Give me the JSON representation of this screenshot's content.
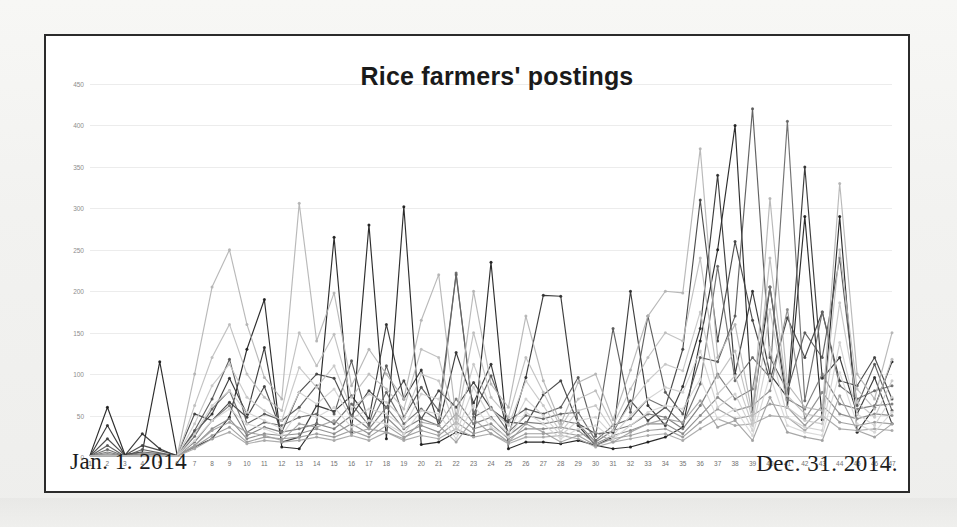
{
  "page": {
    "background": "#f4f4f2",
    "frame_border_color": "#2b2b2b",
    "plate_color": "#ffffff"
  },
  "chart_data": {
    "type": "line",
    "title": "Rice farmers' postings",
    "xlabel": "",
    "ylabel": "",
    "grid": true,
    "legend": "none",
    "xlim": [
      1,
      47
    ],
    "ylim": [
      0,
      450
    ],
    "ytick_values": [
      0,
      50,
      100,
      150,
      200,
      250,
      300,
      350,
      400,
      450
    ],
    "ytick_labels": [
      "0",
      "50",
      "100",
      "150",
      "200",
      "250",
      "300",
      "350",
      "400",
      "450"
    ],
    "categories": [
      1,
      2,
      3,
      4,
      5,
      6,
      7,
      8,
      9,
      10,
      11,
      12,
      13,
      14,
      15,
      16,
      17,
      18,
      19,
      20,
      21,
      22,
      23,
      24,
      25,
      26,
      27,
      28,
      29,
      30,
      31,
      32,
      33,
      34,
      35,
      36,
      37,
      38,
      39,
      40,
      41,
      42,
      43,
      44,
      45,
      46,
      47
    ],
    "xtick_labels": [
      "1",
      "2",
      "3",
      "4",
      "5",
      "6",
      "7",
      "8",
      "9",
      "10",
      "11",
      "12",
      "13",
      "14",
      "15",
      "16",
      "17",
      "18",
      "19",
      "20",
      "21",
      "22",
      "23",
      "24",
      "25",
      "26",
      "27",
      "28",
      "29",
      "30",
      "31",
      "32",
      "33",
      "34",
      "35",
      "36",
      "37",
      "38",
      "39",
      "40",
      "41",
      "42",
      "43",
      "44",
      "45",
      "46",
      "47"
    ],
    "annotations": {
      "start_date": "Jan. 1. 2014",
      "end_date": "Dec. 31. 2014."
    },
    "series": [
      {
        "name": "series-1",
        "color": "#1b1b1b",
        "values": [
          2,
          60,
          3,
          6,
          115,
          2,
          12,
          22,
          48,
          130,
          190,
          12,
          10,
          40,
          265,
          30,
          280,
          22,
          302,
          15,
          18,
          30,
          25,
          235,
          10,
          18,
          18,
          16,
          20,
          14,
          10,
          12,
          18,
          24,
          36,
          140,
          250,
          400,
          55,
          205,
          60,
          290,
          45,
          290,
          30,
          60,
          115
        ]
      },
      {
        "name": "series-2",
        "color": "#2e2e2e",
        "values": [
          1,
          38,
          2,
          28,
          10,
          1,
          30,
          52,
          95,
          52,
          132,
          18,
          24,
          62,
          55,
          74,
          46,
          160,
          70,
          105,
          38,
          126,
          65,
          112,
          26,
          96,
          195,
          194,
          38,
          14,
          24,
          200,
          62,
          38,
          85,
          155,
          340,
          100,
          200,
          100,
          72,
          350,
          95,
          120,
          52,
          96,
          40
        ]
      },
      {
        "name": "series-3",
        "color": "#3f3f3f",
        "values": [
          1,
          22,
          2,
          14,
          8,
          2,
          52,
          44,
          66,
          48,
          85,
          30,
          78,
          100,
          95,
          50,
          80,
          60,
          92,
          46,
          80,
          60,
          90,
          58,
          42,
          40,
          75,
          92,
          40,
          28,
          30,
          68,
          44,
          60,
          130,
          310,
          140,
          260,
          165,
          92,
          168,
          120,
          175,
          92,
          86,
          120,
          70
        ]
      },
      {
        "name": "series-4",
        "color": "#555555",
        "values": [
          1,
          14,
          1,
          9,
          5,
          1,
          32,
          70,
          118,
          40,
          52,
          44,
          60,
          86,
          52,
          116,
          40,
          110,
          48,
          84,
          56,
          220,
          52,
          98,
          44,
          58,
          52,
          60,
          96,
          25,
          155,
          54,
          170,
          78,
          52,
          120,
          115,
          170,
          420,
          120,
          80,
          150,
          120,
          240,
          62,
          112,
          56
        ]
      },
      {
        "name": "series-5",
        "color": "#666666",
        "values": [
          1,
          9,
          1,
          6,
          4,
          1,
          25,
          58,
          80,
          30,
          42,
          38,
          48,
          52,
          40,
          64,
          38,
          78,
          40,
          58,
          44,
          222,
          48,
          60,
          30,
          50,
          46,
          52,
          54,
          20,
          38,
          46,
          70,
          60,
          40,
          88,
          230,
          92,
          120,
          96,
          405,
          68,
          175,
          86,
          70,
          80,
          86
        ]
      },
      {
        "name": "series-6",
        "color": "#777777",
        "values": [
          1,
          6,
          1,
          4,
          3,
          1,
          18,
          44,
          62,
          26,
          36,
          30,
          34,
          40,
          34,
          50,
          34,
          60,
          34,
          46,
          38,
          70,
          40,
          48,
          26,
          42,
          40,
          44,
          40,
          18,
          32,
          38,
          52,
          48,
          34,
          62,
          100,
          70,
          82,
          205,
          70,
          58,
          100,
          64,
          58,
          62,
          64
        ]
      },
      {
        "name": "series-7",
        "color": "#888888",
        "values": [
          1,
          4,
          1,
          3,
          2,
          1,
          14,
          34,
          46,
          22,
          28,
          26,
          28,
          34,
          28,
          40,
          28,
          48,
          28,
          38,
          30,
          52,
          34,
          40,
          22,
          34,
          34,
          36,
          32,
          16,
          26,
          32,
          40,
          40,
          28,
          50,
          72,
          56,
          62,
          80,
          178,
          46,
          78,
          52,
          46,
          52,
          50
        ]
      },
      {
        "name": "series-8",
        "color": "#999999",
        "values": [
          1,
          3,
          1,
          2,
          2,
          1,
          12,
          26,
          36,
          18,
          24,
          22,
          24,
          28,
          24,
          32,
          24,
          38,
          24,
          32,
          26,
          42,
          28,
          34,
          18,
          28,
          28,
          30,
          26,
          14,
          22,
          26,
          32,
          34,
          24,
          42,
          58,
          46,
          50,
          64,
          60,
          38,
          62,
          42,
          38,
          42,
          40
        ]
      },
      {
        "name": "series-9",
        "color": "#a6a6a6",
        "values": [
          1,
          2,
          1,
          2,
          1,
          1,
          10,
          22,
          30,
          16,
          20,
          18,
          20,
          24,
          20,
          26,
          20,
          30,
          20,
          26,
          22,
          34,
          24,
          28,
          16,
          24,
          24,
          26,
          22,
          12,
          18,
          22,
          26,
          28,
          20,
          34,
          46,
          38,
          40,
          50,
          48,
          32,
          50,
          34,
          32,
          34,
          32
        ]
      },
      {
        "name": "series-10",
        "color": "#b3b3b3",
        "values": [
          1,
          2,
          1,
          1,
          1,
          1,
          100,
          205,
          250,
          160,
          96,
          70,
          306,
          140,
          198,
          86,
          130,
          100,
          70,
          165,
          220,
          46,
          200,
          88,
          60,
          170,
          92,
          40,
          90,
          100,
          45,
          105,
          170,
          200,
          198,
          372,
          120,
          160,
          50,
          312,
          88,
          60,
          56,
          330,
          100,
          70,
          150
        ]
      },
      {
        "name": "series-11",
        "color": "#bdbdbd",
        "values": [
          1,
          1,
          1,
          1,
          1,
          1,
          62,
          120,
          160,
          100,
          72,
          56,
          150,
          110,
          148,
          72,
          100,
          82,
          58,
          130,
          120,
          40,
          150,
          72,
          48,
          120,
          78,
          36,
          70,
          80,
          38,
          82,
          120,
          150,
          140,
          240,
          96,
          128,
          44,
          240,
          74,
          52,
          48,
          250,
          82,
          58,
          118
        ]
      },
      {
        "name": "series-12",
        "color": "#c6c6c6",
        "values": [
          1,
          1,
          1,
          1,
          1,
          1,
          40,
          86,
          112,
          72,
          56,
          44,
          108,
          84,
          110,
          58,
          76,
          66,
          46,
          100,
          92,
          34,
          112,
          58,
          38,
          92,
          62,
          30,
          56,
          62,
          32,
          64,
          92,
          112,
          104,
          175,
          76,
          98,
          38,
          178,
          60,
          44,
          40,
          186,
          66,
          48,
          92
        ]
      },
      {
        "name": "series-13",
        "color": "#cfcfcf",
        "values": [
          1,
          1,
          1,
          1,
          1,
          1,
          28,
          62,
          80,
          54,
          44,
          34,
          78,
          64,
          82,
          46,
          58,
          52,
          36,
          76,
          70,
          28,
          84,
          46,
          30,
          70,
          50,
          26,
          44,
          48,
          26,
          50,
          70,
          84,
          78,
          128,
          60,
          76,
          32,
          132,
          48,
          36,
          32,
          138,
          52,
          38,
          72
        ]
      },
      {
        "name": "series-14",
        "color": "#d6d6d6",
        "values": [
          1,
          1,
          1,
          1,
          1,
          1,
          20,
          44,
          58,
          40,
          34,
          26,
          56,
          48,
          60,
          36,
          44,
          40,
          28,
          56,
          52,
          22,
          62,
          36,
          24,
          54,
          40,
          22,
          34,
          38,
          22,
          38,
          54,
          62,
          58,
          94,
          46,
          58,
          26,
          98,
          38,
          30,
          26,
          102,
          40,
          30,
          54
        ]
      },
      {
        "name": "series-15",
        "color": "#9f9f9f",
        "values": [
          1,
          1,
          1,
          1,
          1,
          1,
          14,
          32,
          42,
          30,
          26,
          20,
          40,
          36,
          44,
          28,
          34,
          30,
          22,
          42,
          38,
          18,
          46,
          28,
          18,
          40,
          30,
          18,
          26,
          30,
          18,
          30,
          40,
          46,
          42,
          68,
          36,
          44,
          20,
          72,
          30,
          24,
          20,
          74,
          32,
          24,
          40
        ]
      }
    ]
  }
}
